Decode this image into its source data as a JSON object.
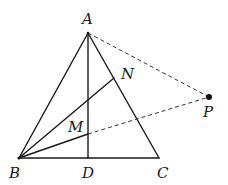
{
  "figure": {
    "type": "geometry",
    "points": {
      "A": {
        "label": "A",
        "x": 88,
        "y": 33
      },
      "B": {
        "label": "B",
        "x": 19,
        "y": 158
      },
      "C": {
        "label": "C",
        "x": 159,
        "y": 158
      },
      "D": {
        "label": "D",
        "x": 88,
        "y": 158
      },
      "N": {
        "label": "N",
        "x": 114,
        "y": 78
      },
      "M": {
        "label": "M",
        "x": 88,
        "y": 134
      },
      "P": {
        "label": "P",
        "x": 209,
        "y": 97
      }
    },
    "solid_segments": [
      [
        "A",
        "B"
      ],
      [
        "A",
        "C"
      ],
      [
        "B",
        "C"
      ],
      [
        "A",
        "D"
      ],
      [
        "B",
        "N"
      ],
      [
        "B",
        "M"
      ]
    ],
    "dashed_segments": [
      [
        "A",
        "P"
      ],
      [
        "M",
        "P"
      ]
    ],
    "marked_points": [
      "P"
    ],
    "colors": {
      "line": "#1a1a1a",
      "dashed": "#333333",
      "background": "#ffffff"
    }
  }
}
